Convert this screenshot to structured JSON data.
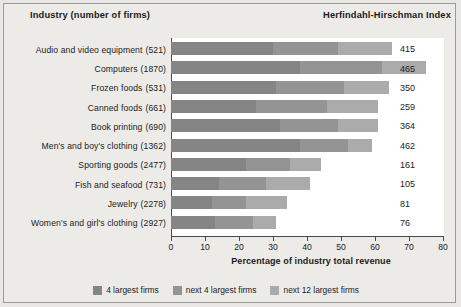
{
  "header": {
    "left_title": "Industry (number of firms)",
    "right_title": "Herfindahl-Hirschman Index"
  },
  "legend": {
    "items": [
      {
        "label": "4 largest firms",
        "color": "#858585"
      },
      {
        "label": "next 4 largest firms",
        "color": "#949494"
      },
      {
        "label": "next 12 largest firms",
        "color": "#ababab"
      }
    ]
  },
  "chart_data": {
    "type": "bar",
    "orientation": "horizontal",
    "stacked": true,
    "title": "",
    "xlabel": "Percentage of industry total revenue",
    "ylabel": "Industry (number of firms)",
    "xlim": [
      0,
      80
    ],
    "xticks": [
      0,
      10,
      20,
      30,
      40,
      50,
      60,
      70,
      80
    ],
    "grid": false,
    "legend_position": "bottom",
    "categories": [
      "Audio and video equipment",
      "Computers",
      "Frozen foods",
      "Canned foods",
      "Book printing",
      "Men's and boy's clothing",
      "Sporting goods",
      "Fish and seafood",
      "Jewelry",
      "Women's and girl's clothing"
    ],
    "firm_counts": [
      "(521)",
      "(1870)",
      "(531)",
      "(661)",
      "(690)",
      "(1362)",
      "(2477)",
      "(731)",
      "(2278)",
      "(2927)"
    ],
    "series": [
      {
        "name": "4 largest firms",
        "values": [
          30,
          38,
          31,
          25,
          32,
          38,
          22,
          14,
          12,
          13
        ]
      },
      {
        "name": "next 4 largest firms",
        "values": [
          19,
          24,
          20,
          21,
          17,
          14,
          13,
          14,
          10,
          11
        ]
      },
      {
        "name": "next 12 largest firms",
        "values": [
          16,
          13,
          13,
          15,
          12,
          7,
          9,
          13,
          12,
          7
        ]
      }
    ],
    "totals": [
      65,
      75,
      64,
      61,
      61,
      59,
      44,
      41,
      34,
      31
    ],
    "hhi_label": "Herfindahl-Hirschman Index",
    "hhi_values": [
      415,
      465,
      350,
      259,
      364,
      462,
      161,
      105,
      81,
      76
    ]
  }
}
